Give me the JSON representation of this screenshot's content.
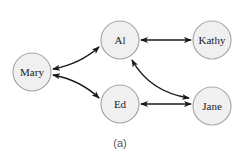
{
  "diagram": {
    "type": "social-graph",
    "caption": "(a)",
    "colors": {
      "node_fill": "#f0f0f0",
      "node_stroke": "#a9a9a9",
      "edge": "#1a1a1a",
      "label": "#222222",
      "caption": "#555555"
    },
    "nodes": [
      {
        "id": "mary",
        "label": "Mary",
        "cx": 32,
        "cy": 72,
        "r": 19
      },
      {
        "id": "al",
        "label": "Al",
        "cx": 120,
        "cy": 40,
        "r": 19
      },
      {
        "id": "kathy",
        "label": "Kathy",
        "cx": 212,
        "cy": 40,
        "r": 19
      },
      {
        "id": "ed",
        "label": "Ed",
        "cx": 120,
        "cy": 104,
        "r": 19
      },
      {
        "id": "jane",
        "label": "Jane",
        "cx": 212,
        "cy": 106,
        "r": 19
      }
    ],
    "edges": [
      {
        "from": "Mary",
        "to": "Al",
        "direction": "bidirectional",
        "shape": "curved"
      },
      {
        "from": "Mary",
        "to": "Ed",
        "direction": "bidirectional",
        "shape": "curved"
      },
      {
        "from": "Al",
        "to": "Kathy",
        "direction": "bidirectional",
        "shape": "straight"
      },
      {
        "from": "Al",
        "to": "Jane",
        "direction": "bidirectional",
        "shape": "curved"
      },
      {
        "from": "Ed",
        "to": "Jane",
        "direction": "bidirectional",
        "shape": "straight"
      }
    ]
  }
}
